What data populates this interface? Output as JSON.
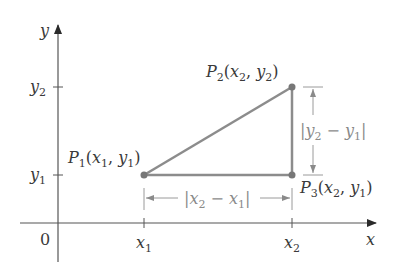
{
  "diagram": {
    "colors": {
      "axis": "#3a3a3a",
      "triangle": "#8c8c8c",
      "point": "#7a7a7a",
      "dimension": "#9a9a9a",
      "text": "#3a3a3a"
    },
    "axes": {
      "x_label": "x",
      "y_label": "y",
      "origin_label": "0",
      "x_ticks": [
        {
          "base": "x",
          "sub": "1"
        },
        {
          "base": "x",
          "sub": "2"
        }
      ],
      "y_ticks": [
        {
          "base": "y",
          "sub": "2"
        },
        {
          "base": "y",
          "sub": "1"
        }
      ]
    },
    "points": [
      {
        "name": "P",
        "sub": "1",
        "coords": "(x1, y1)",
        "x_base": "x",
        "x_sub": "1",
        "y_base": "y",
        "y_sub": "1"
      },
      {
        "name": "P",
        "sub": "2",
        "coords": "(x2, y2)",
        "x_base": "x",
        "x_sub": "2",
        "y_base": "y",
        "y_sub": "2"
      },
      {
        "name": "P",
        "sub": "3",
        "coords": "(x2, y1)",
        "x_base": "x",
        "x_sub": "2",
        "y_base": "y",
        "y_sub": "1"
      }
    ],
    "dimensions": {
      "horizontal": {
        "text": "|x2 − x1|",
        "a_base": "x",
        "a_sub": "2",
        "b_base": "x",
        "b_sub": "1",
        "op": "−"
      },
      "vertical": {
        "text": "|y2 − y1|",
        "a_base": "y",
        "a_sub": "2",
        "b_base": "y",
        "b_sub": "1",
        "op": "−"
      }
    }
  }
}
